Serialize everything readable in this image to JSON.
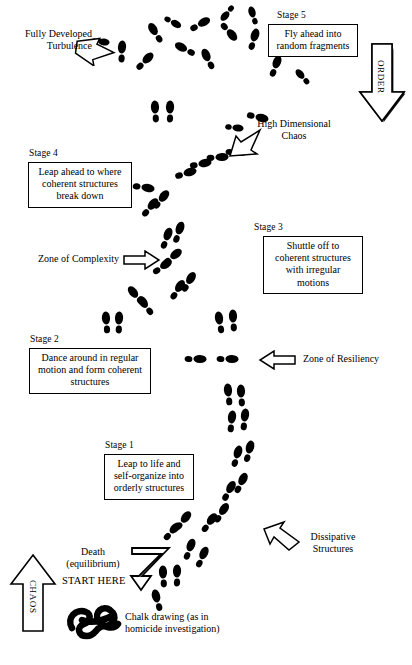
{
  "diagram": {
    "background_color": "#ffffff",
    "ink_color": "#000000"
  },
  "axis_arrows": [
    {
      "name": "order-arrow",
      "label": "ORDER",
      "direction": "down",
      "position": "top-right"
    },
    {
      "name": "chaos-arrow",
      "label": "CHAOS",
      "direction": "up",
      "position": "bottom-left"
    }
  ],
  "stages": [
    {
      "id": "stage5",
      "stage_label": "Stage 5",
      "lines": [
        "Fly ahead into",
        "random fragments"
      ]
    },
    {
      "id": "stage4",
      "stage_label": "Stage 4",
      "lines": [
        "Leap ahead to where",
        "coherent structures",
        "break down"
      ]
    },
    {
      "id": "stage3",
      "stage_label": "Stage 3",
      "lines": [
        "Shuttle off to",
        "coherent structures",
        "with irregular motions"
      ]
    },
    {
      "id": "stage2",
      "stage_label": "Stage 2",
      "lines": [
        "Dance around in regular",
        "motion and form coherent",
        "structures"
      ]
    },
    {
      "id": "stage1",
      "stage_label": "Stage 1",
      "lines": [
        "Leap to life and",
        "self-organize into",
        "orderly structures"
      ]
    }
  ],
  "annotations": [
    {
      "id": "fully-developed-turbulence",
      "lines": [
        "Fully Developed",
        "Turbulence"
      ],
      "arrow": "arrow-right-down"
    },
    {
      "id": "high-dimensional-chaos",
      "lines": [
        "High Dimensional",
        "Chaos"
      ],
      "arrow": "arrow-left-down"
    },
    {
      "id": "zone-of-complexity",
      "lines": [
        "Zone of Complexity"
      ],
      "arrow": "arrow-right"
    },
    {
      "id": "zone-of-resiliency",
      "lines": [
        "Zone of Resiliency"
      ],
      "arrow": "arrow-left"
    },
    {
      "id": "dissipative-structures",
      "lines": [
        "Dissipative",
        "Structures"
      ],
      "arrow": "arrow-up-left"
    },
    {
      "id": "death-equilibrium",
      "lines": [
        "Death",
        "(equilibrium)"
      ],
      "arrow": "zigzag-arrow-down"
    },
    {
      "id": "start-here",
      "lines": [
        "START HERE"
      ],
      "arrow": "zigzag-arrow-down"
    },
    {
      "id": "chalk-drawing",
      "lines": [
        "Chalk drawing (as in",
        "homicide investigation)"
      ],
      "arrow": "none"
    }
  ],
  "footprints": {
    "description": "Trail of shoe prints (sole + heel pairs) running from bottom-left start point up to scattered fragments at top",
    "count_groups": 26
  }
}
